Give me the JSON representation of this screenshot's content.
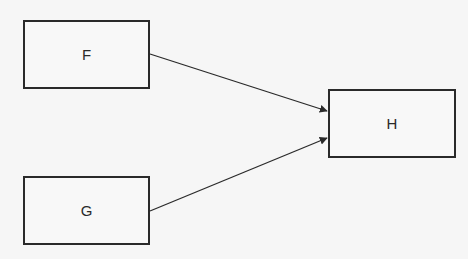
{
  "diagram": {
    "nodes": [
      {
        "id": "F",
        "label": "F"
      },
      {
        "id": "G",
        "label": "G"
      },
      {
        "id": "H",
        "label": "H"
      }
    ],
    "edges": [
      {
        "from": "F",
        "to": "H"
      },
      {
        "from": "G",
        "to": "H"
      }
    ],
    "colors": {
      "stroke": "#2a2a2a",
      "background": "#f6f6f6"
    }
  }
}
